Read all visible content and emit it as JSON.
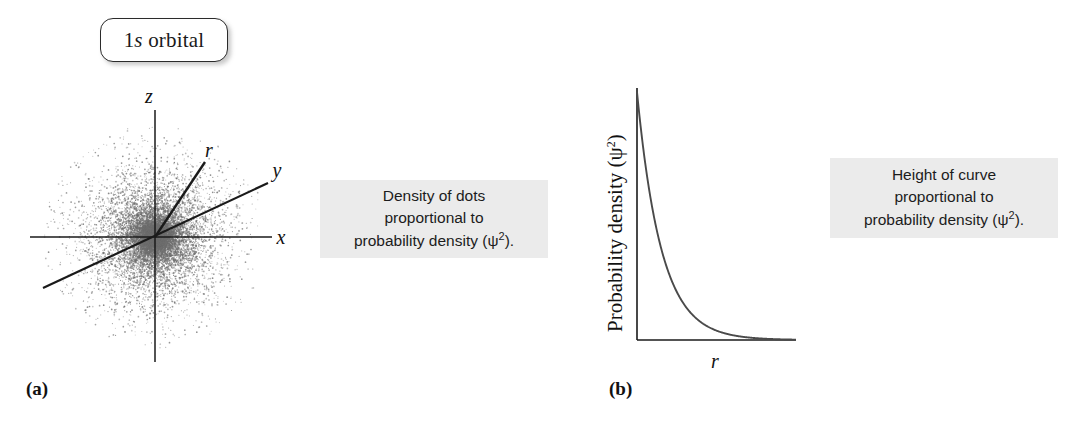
{
  "figure": {
    "badge_label_prefix": "1",
    "badge_label_italic": "s",
    "badge_label_suffix": " orbital"
  },
  "panel_a": {
    "letter": "(a)",
    "axes": {
      "z": "z",
      "x": "x",
      "y": "y",
      "r": "r"
    }
  },
  "panel_b": {
    "letter": "(b)",
    "axes": {
      "x_label": "r",
      "y_label_text": "Probability density (ψ",
      "y_label_sup": "2",
      "y_label_tail": ")"
    }
  },
  "annotations": {
    "dots": {
      "line1": "Density of dots",
      "line2": "proportional to",
      "line3_pre": "probability density  (ψ",
      "line3_sup": "2",
      "line3_post": ")."
    },
    "height": {
      "line1": "Height of curve",
      "line2": "proportional to",
      "line3_pre": "probability density  (ψ",
      "line3_sup": "2",
      "line3_post": ")."
    }
  },
  "chart_data": {
    "type": "line",
    "title": "",
    "xlabel": "r",
    "ylabel": "Probability density (ψ²)",
    "function": "psi_squared(r) = exp(-2r/a0)",
    "x": [
      0.0,
      0.05,
      0.1,
      0.15,
      0.2,
      0.25,
      0.3,
      0.35,
      0.4,
      0.5,
      0.6,
      0.7,
      0.8,
      0.9,
      1.0
    ],
    "values": [
      1.0,
      0.72,
      0.52,
      0.38,
      0.28,
      0.21,
      0.155,
      0.118,
      0.09,
      0.055,
      0.034,
      0.022,
      0.014,
      0.009,
      0.006
    ],
    "xlim": [
      0,
      1
    ],
    "ylim": [
      0,
      1
    ],
    "grid": false,
    "legend": false,
    "curve_color": "#4a4a4a",
    "axis_color": "#1a1a1a"
  },
  "colors": {
    "annotation_background": "#ebebeb",
    "badge_border": "#2b2b2b",
    "cloud_dot": "#6e6e6e",
    "axis": "#1a1a1a"
  }
}
